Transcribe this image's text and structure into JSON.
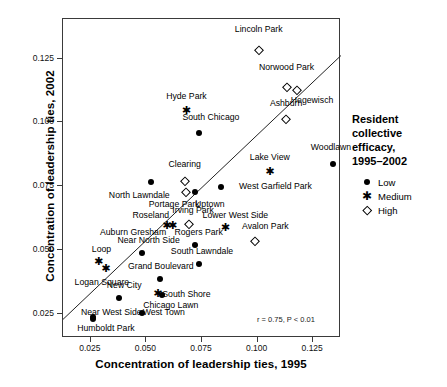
{
  "chart_data": {
    "type": "scatter",
    "title": "",
    "xlabel": "Concentration of leadership ties, 1995",
    "ylabel": "Concentration of leadership ties, 2002",
    "xlim": [
      0.0125,
      0.1375
    ],
    "ylim": [
      0.0155,
      0.1405
    ],
    "xticks": [
      "0.025",
      "0.050",
      "0.075",
      "0.100",
      "0.125"
    ],
    "xtickvalues": [
      0.025,
      0.05,
      0.075,
      0.1,
      0.125
    ],
    "yticks": [
      "0.025",
      "0.050",
      "0.075",
      "0.100",
      "0.125"
    ],
    "ytickvalues": [
      0.025,
      0.05,
      0.075,
      0.1,
      0.125
    ],
    "grid": false,
    "annotation": "r = 0.75, P < 0.01",
    "legend_position": "right",
    "trendline": {
      "x0": 0.0125,
      "y0": 0.0228,
      "x1": 0.1375,
      "y1": 0.1262
    },
    "groups": [
      {
        "name": "Low",
        "marker": "filled-circle"
      },
      {
        "name": "Medium",
        "marker": "star"
      },
      {
        "name": "High",
        "marker": "open-diamond"
      }
    ],
    "points": [
      {
        "label": "Lincoln Park",
        "x": 0.1005,
        "y": 0.1285,
        "group": "High",
        "lx": 0.1005,
        "ly": 0.136,
        "align": "c"
      },
      {
        "label": "Norwood Park",
        "x": 0.113,
        "y": 0.114,
        "group": "High",
        "lx": 0.113,
        "ly": 0.1212,
        "align": "c"
      },
      {
        "label": "Hegewisch",
        "x": 0.1175,
        "y": 0.1128,
        "group": "High",
        "lx": 0.1245,
        "ly": 0.1082,
        "align": "c"
      },
      {
        "label": "Ashburn",
        "x": 0.1128,
        "y": 0.1012,
        "group": "High",
        "lx": 0.1128,
        "ly": 0.107,
        "align": "c"
      },
      {
        "label": "Hyde Park",
        "x": 0.068,
        "y": 0.104,
        "group": "Medium",
        "lx": 0.068,
        "ly": 0.1098,
        "align": "c"
      },
      {
        "label": "South Chicago",
        "x": 0.0735,
        "y": 0.0958,
        "group": "Low",
        "lx": 0.079,
        "ly": 0.1018,
        "align": "c"
      },
      {
        "label": "Woodlawn",
        "x": 0.134,
        "y": 0.0838,
        "group": "Low",
        "lx": 0.133,
        "ly": 0.0898,
        "align": "c"
      },
      {
        "label": "Lake View",
        "x": 0.1055,
        "y": 0.08,
        "group": "Medium",
        "lx": 0.1055,
        "ly": 0.0862,
        "align": "c"
      },
      {
        "label": "Clearing",
        "x": 0.0672,
        "y": 0.0772,
        "group": "High",
        "lx": 0.0672,
        "ly": 0.0832,
        "align": "c"
      },
      {
        "label": "North Lawndale",
        "x": 0.0522,
        "y": 0.0768,
        "group": "Low",
        "lx": 0.0468,
        "ly": 0.0712,
        "align": "c"
      },
      {
        "label": "West Garfield Park",
        "x": 0.0835,
        "y": 0.0745,
        "group": "Low",
        "lx": 0.108,
        "ly": 0.0745,
        "align": "c"
      },
      {
        "label": "Portage Park",
        "x": 0.068,
        "y": 0.0728,
        "group": "High",
        "lx": 0.0625,
        "ly": 0.0678,
        "align": "c"
      },
      {
        "label": "Uptown",
        "x": 0.0718,
        "y": 0.0728,
        "group": "Low",
        "lx": 0.0785,
        "ly": 0.0678,
        "align": "c"
      },
      {
        "label": "Irving Park",
        "x": 0.069,
        "y": 0.0602,
        "group": "High",
        "lx": 0.071,
        "ly": 0.0652,
        "align": "c"
      },
      {
        "label": "Lower West Side",
        "x": 0.0855,
        "y": 0.0582,
        "group": "Medium",
        "lx": 0.09,
        "ly": 0.0632,
        "align": "c"
      },
      {
        "label": "Roseland",
        "x": 0.0618,
        "y": 0.0588,
        "group": "Medium",
        "lx": 0.052,
        "ly": 0.0632,
        "align": "c"
      },
      {
        "label": "Auburn Gresham",
        "x": 0.0592,
        "y": 0.0588,
        "group": "Medium",
        "lx": 0.044,
        "ly": 0.0565,
        "align": "c"
      },
      {
        "label": "Avalon Park",
        "x": 0.099,
        "y": 0.0535,
        "group": "High",
        "lx": 0.1035,
        "ly": 0.0588,
        "align": "c"
      },
      {
        "label": "Rogers Park",
        "x": 0.0718,
        "y": 0.0518,
        "group": "Low",
        "lx": 0.0735,
        "ly": 0.0568,
        "align": "c"
      },
      {
        "label": "Near North Side",
        "x": 0.0478,
        "y": 0.0488,
        "group": "Low",
        "lx": 0.051,
        "ly": 0.0535,
        "align": "c"
      },
      {
        "label": "South Lawndale",
        "x": 0.0738,
        "y": 0.0445,
        "group": "Low",
        "lx": 0.075,
        "ly": 0.0492,
        "align": "c"
      },
      {
        "label": "Loop",
        "x": 0.0285,
        "y": 0.0448,
        "group": "Medium",
        "lx": 0.0298,
        "ly": 0.0498,
        "align": "c"
      },
      {
        "label": "Logan Square",
        "x": 0.0318,
        "y": 0.0422,
        "group": "Medium",
        "lx": 0.03,
        "ly": 0.0372,
        "align": "c"
      },
      {
        "label": "Grand Boulevard",
        "x": 0.056,
        "y": 0.0388,
        "group": "Low",
        "lx": 0.0565,
        "ly": 0.0435,
        "align": "c"
      },
      {
        "label": "New City",
        "x": 0.0375,
        "y": 0.0312,
        "group": "Low",
        "lx": 0.04,
        "ly": 0.0358,
        "align": "c"
      },
      {
        "label": "South Shore",
        "x": 0.057,
        "y": 0.0325,
        "group": "Low",
        "lx": 0.068,
        "ly": 0.0325,
        "align": "c"
      },
      {
        "label": "Chicago Lawn",
        "x": 0.0552,
        "y": 0.0325,
        "group": "Medium",
        "lx": 0.061,
        "ly": 0.0282,
        "align": "c"
      },
      {
        "label": "West Town",
        "x": 0.0478,
        "y": 0.0252,
        "group": "Low",
        "lx": 0.0578,
        "ly": 0.0252,
        "align": "c"
      },
      {
        "label": "Near West Side",
        "x": 0.0258,
        "y": 0.0238,
        "group": "Low",
        "lx": 0.0342,
        "ly": 0.0252,
        "align": "c"
      },
      {
        "label": "Humboldt Park",
        "x": 0.0262,
        "y": 0.0228,
        "group": "Low",
        "lx": 0.0318,
        "ly": 0.019,
        "align": "c"
      }
    ]
  },
  "legend": {
    "title_lines": [
      "Resident",
      "collective",
      "efficacy,",
      "1995–2002"
    ],
    "items": [
      {
        "label": "Low",
        "marker": "filled-circle"
      },
      {
        "label": "Medium",
        "marker": "star"
      },
      {
        "label": "High",
        "marker": "open-diamond"
      }
    ]
  }
}
